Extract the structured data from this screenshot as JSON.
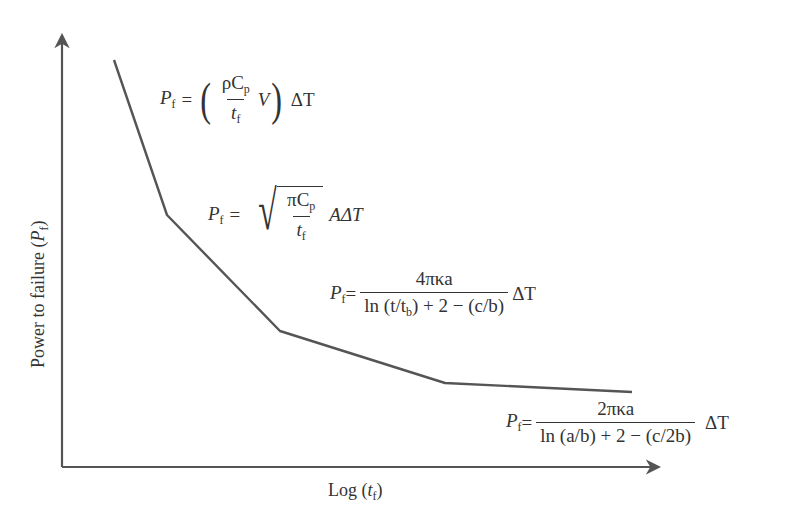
{
  "diagram": {
    "type": "piecewise-line-plot",
    "x_axis_label": {
      "prefix": "Log (",
      "var": "t",
      "sub": "f",
      "suffix": ")"
    },
    "y_axis_label": {
      "prefix": "Power to failure (",
      "var": "P",
      "sub": "f",
      "suffix": ")"
    },
    "line_points": [
      [
        114,
        60
      ],
      [
        167,
        215
      ],
      [
        280,
        331
      ],
      [
        445,
        383
      ],
      [
        632,
        392
      ]
    ],
    "colors": {
      "line": "#555555",
      "axis": "#555555",
      "text": "#333333"
    },
    "equations": [
      {
        "id": "eq1",
        "lhs_var": "P",
        "lhs_sub": "f",
        "equals": "=",
        "num_a": "ρC",
        "num_sub": "p",
        "den_var": "t",
        "den_sub": "f",
        "after_frac": "V",
        "tail": "ΔT",
        "text": "P_f = (ρC_p / t_f V) ΔT"
      },
      {
        "id": "eq2",
        "lhs_var": "P",
        "lhs_sub": "f",
        "equals": "=",
        "num_a": "πC",
        "num_sub": "p",
        "den_var": "t",
        "den_sub": "f",
        "after_frac": "AΔT",
        "text": "P_f = sqrt(πC_p / t_f) AΔT"
      },
      {
        "id": "eq3",
        "lhs_var": "P",
        "lhs_sub": "f",
        "equals": "=",
        "num": "4πκa",
        "den_a": "ln (t/t",
        "den_sub": "b",
        "den_b": ") + 2 − (c/b)",
        "tail": "ΔT",
        "text": "P_f = 4πκa / (ln(t/t_b) + 2 − (c/b)) ΔT"
      },
      {
        "id": "eq4",
        "lhs_var": "P",
        "lhs_sub": "f",
        "equals": "=",
        "num": "2πκa",
        "den": "ln (a/b) + 2 − (c/2b)",
        "tail": "ΔT",
        "text": "P_f = 2πκa / (ln(a/b) + 2 − (c/2b)) ΔT"
      }
    ]
  }
}
